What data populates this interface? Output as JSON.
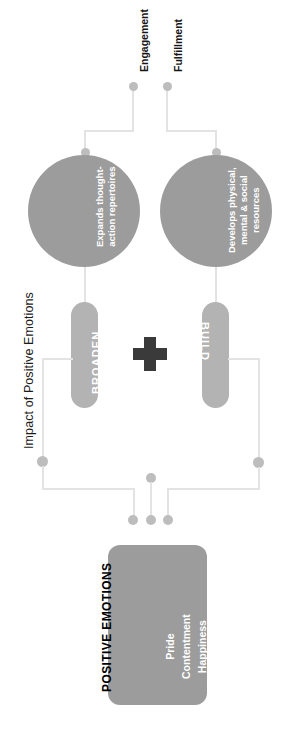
{
  "diagram": {
    "section_title": "Impact of Positive Emotions",
    "outcomes": [
      {
        "label": "Engagement"
      },
      {
        "label": "Fulfillment"
      }
    ],
    "circles": [
      {
        "id": "broaden-circle",
        "text": "Expands thought-\naction repertoires"
      },
      {
        "id": "build-circle",
        "text": "Develops physical,\nmental & social\nresources"
      }
    ],
    "pills": [
      {
        "id": "broaden-pill",
        "label": "BROADEN"
      },
      {
        "id": "build-pill",
        "label": "BUILD"
      }
    ],
    "operator": {
      "name": "plus-icon",
      "symbol": "+"
    },
    "source_box": {
      "title": "POSITIVE EMOTIONS",
      "items": [
        "Pride",
        "Contentment",
        "Happiness"
      ],
      "items_text": "Pride\nContentment\nHappiness"
    },
    "colors": {
      "circle_fill": "#9c9c9c",
      "pill_fill": "#b3b3b3",
      "box_fill": "#9c9c9c",
      "connector": "#e3e3e3",
      "dot": "#bdbdbd",
      "plus": "#3a3a3a",
      "text_dark": "#161616",
      "text_light": "#ffffff",
      "background": "#ffffff"
    }
  }
}
